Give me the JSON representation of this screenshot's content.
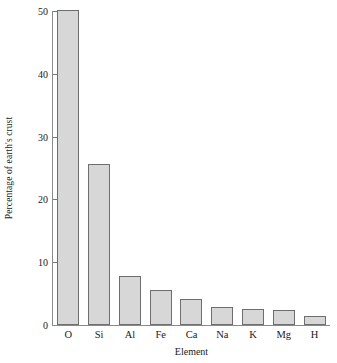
{
  "chart_data": {
    "type": "bar",
    "title": "",
    "xlabel": "Element",
    "ylabel": "Percentage of earth's crust",
    "categories": [
      "O",
      "Si",
      "Al",
      "Fe",
      "Ca",
      "Na",
      "K",
      "Mg",
      "H"
    ],
    "values": [
      50.2,
      25.7,
      7.8,
      5.6,
      4.1,
      2.8,
      2.6,
      2.4,
      1.4
    ],
    "ylim": [
      0,
      50
    ],
    "yticks": [
      0,
      10,
      20,
      30,
      40,
      50
    ],
    "ytick_labels": [
      "0",
      "10",
      "20",
      "30",
      "40",
      "50"
    ],
    "xlim_categories": 9,
    "grid": false,
    "legend": false,
    "legend_position": "none",
    "bar_fill_color": "#d7d7d7",
    "bar_edge_color": "#6e6e6e",
    "axis_color": "#8a8a8a",
    "text_color": "#1a1a1a",
    "background_color": "#ffffff"
  }
}
